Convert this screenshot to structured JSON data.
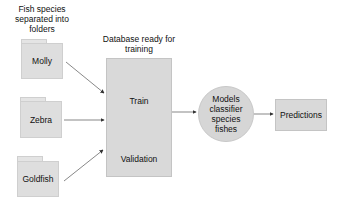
{
  "source_group": {
    "title": "Fish species separated into folders",
    "title_lines": [
      "Fish species",
      "separated into",
      "folders"
    ],
    "folders": [
      {
        "label": "Molly"
      },
      {
        "label": "Zebra"
      },
      {
        "label": "Goldfish"
      }
    ]
  },
  "database": {
    "title": "Database ready for training",
    "title_lines": [
      "Database ready for",
      "training"
    ],
    "train_label": "Train",
    "validation_label": "Validation"
  },
  "model": {
    "label": "Models classifier species fishes",
    "lines": [
      "Models",
      "classifier",
      "species",
      "fishes"
    ]
  },
  "output": {
    "label": "Predictions"
  },
  "colors": {
    "node_fill": "#d9d9d9",
    "arrow": "#333333",
    "background": "#ffffff"
  }
}
